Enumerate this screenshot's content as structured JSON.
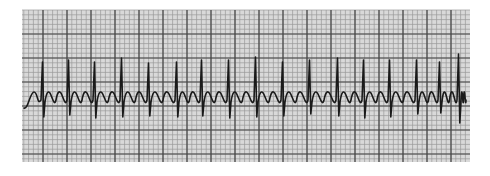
{
  "figure": {
    "paper_color": "#d9d9d9",
    "minor_grid_color": "#9a9a9a",
    "major_grid_color": "#444444",
    "trace_color": "#1a1a1a",
    "background_color": "#ffffff"
  },
  "chart_data": {
    "type": "line",
    "title": "",
    "xlabel": "",
    "ylabel": "",
    "grid": true,
    "legend": "none",
    "strip_bounds_px": {
      "left": 22,
      "top": 10,
      "right": 470,
      "bottom": 162
    },
    "grid_px": {
      "minor_spacing": 4.8,
      "major_spacing": 24,
      "major_x_origin": 19,
      "major_y_origin": 10
    },
    "baseline_y_px": 100,
    "qrs_complexes": {
      "x_px": [
        43,
        69,
        95,
        122,
        149,
        177,
        202,
        229,
        256,
        283,
        310,
        338,
        364,
        390,
        417,
        440,
        459
      ],
      "peak_y_px": [
        62,
        60,
        62,
        58,
        63,
        62,
        60,
        60,
        57,
        62,
        60,
        58,
        60,
        60,
        60,
        62,
        54
      ],
      "trough_y_px": [
        117,
        115,
        118,
        117,
        116,
        117,
        116,
        118,
        117,
        116,
        114,
        116,
        118,
        117,
        114,
        113,
        123
      ]
    },
    "flutter_waves": {
      "per_rr": 2,
      "amplitude_px": 7,
      "min_y_px": 106,
      "max_y_px": 92
    },
    "series": [
      {
        "name": "ECG lead",
        "rate_note": "regular narrow-complex tachycardia with sawtooth flutter waves"
      }
    ]
  }
}
